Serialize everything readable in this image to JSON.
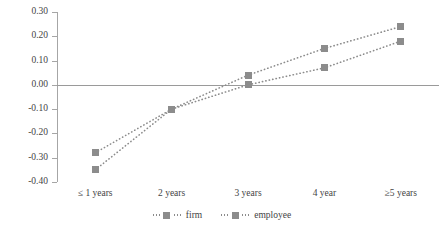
{
  "chart_data": {
    "type": "line",
    "title": "",
    "subtitle": "",
    "xlabel": "",
    "ylabel": "",
    "categories": [
      "≤ 1 years",
      "2 years",
      "3 years",
      "4 year",
      "≥5 years"
    ],
    "series": [
      {
        "name": "firm",
        "values": [
          -0.28,
          -0.1,
          0.04,
          0.15,
          0.24
        ]
      },
      {
        "name": "employee",
        "values": [
          -0.35,
          -0.1,
          0.0,
          0.07,
          0.18
        ]
      }
    ],
    "ylim": [
      -0.4,
      0.3
    ],
    "ytick_labels": [
      "0.30",
      "0.20",
      "0.10",
      "0.00",
      "-0.10",
      "-0.20",
      "-0.30",
      "-0.40"
    ],
    "ytick_values": [
      0.3,
      0.2,
      0.1,
      0.0,
      -0.1,
      -0.2,
      -0.3,
      -0.4
    ],
    "grid": false,
    "legend_position": "bottom",
    "line_style": "dotted",
    "marker": "square",
    "series_color": "#8c8c8c",
    "axis_color": "#a6a6a6",
    "zero_line_color": "#9a9a9a"
  },
  "legend": {
    "entries": [
      {
        "label": "firm"
      },
      {
        "label": "employee"
      }
    ]
  }
}
